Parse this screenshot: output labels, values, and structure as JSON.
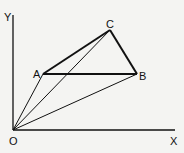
{
  "diagram": {
    "title": "",
    "axes": {
      "x_label": "X",
      "y_label": "Y",
      "origin_label": "O"
    },
    "points": {
      "O": {
        "label": "O",
        "x": 13,
        "y": 130
      },
      "A": {
        "label": "A",
        "x": 43,
        "y": 74
      },
      "B": {
        "label": "B",
        "x": 137,
        "y": 74
      },
      "C": {
        "label": "C",
        "x": 110,
        "y": 30
      }
    },
    "segments": [
      {
        "from": "A",
        "to": "B",
        "weight": "thick"
      },
      {
        "from": "A",
        "to": "C",
        "weight": "thick"
      },
      {
        "from": "C",
        "to": "B",
        "weight": "thick"
      },
      {
        "from": "O",
        "to": "A",
        "weight": "thin"
      },
      {
        "from": "O",
        "to": "C",
        "weight": "thin"
      },
      {
        "from": "O",
        "to": "B",
        "weight": "thin"
      }
    ],
    "colors": {
      "background": "#f4f4f2",
      "stroke": "#111111"
    }
  }
}
